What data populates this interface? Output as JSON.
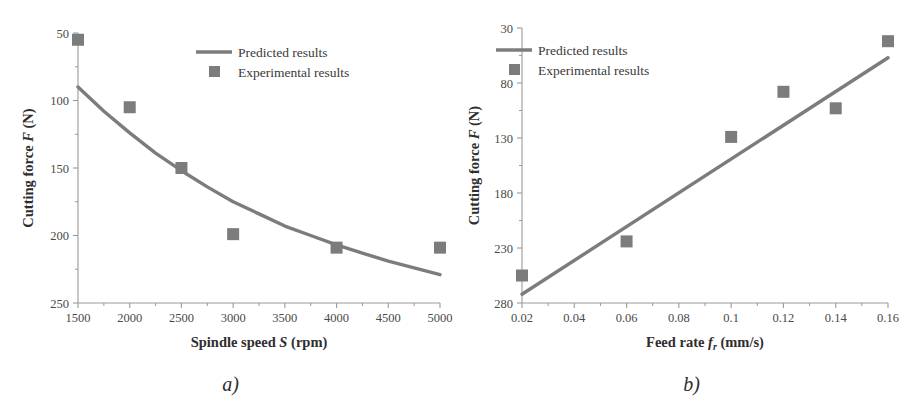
{
  "figure": {
    "background": "#ffffff",
    "series_color": "#7c7c7c",
    "axis_color": "#9a9a9a",
    "text_color": "#3a3a3a"
  },
  "panels": [
    {
      "id": "a",
      "caption": "a)",
      "legend": {
        "line_label": "Predicted results",
        "marker_label": "Experimental results"
      },
      "axes": {
        "xlabel_prefix": "Spindle speed ",
        "xlabel_symbol": "S",
        "xlabel_suffix": " (rpm)",
        "ylabel_prefix": "Cutting force ",
        "ylabel_symbol": "F",
        "ylabel_suffix": " (N)",
        "xticks": [
          "1500",
          "2000",
          "2500",
          "3000",
          "3500",
          "4000",
          "4500",
          "5000"
        ],
        "yticks": [
          "250",
          "200",
          "150",
          "100",
          "50"
        ]
      }
    },
    {
      "id": "b",
      "caption": "b)",
      "legend": {
        "line_label": "Predicted results",
        "marker_label": "Experimental results"
      },
      "axes": {
        "xlabel_prefix": "Feed rate ",
        "xlabel_symbol": "f",
        "xlabel_subscript": "r",
        "xlabel_suffix": " (mm/s)",
        "ylabel_prefix": "Cutting force ",
        "ylabel_symbol": "F",
        "ylabel_suffix": " (N)",
        "xticks": [
          "0.02",
          "0.04",
          "0.06",
          "0.08",
          "0.1",
          "0.12",
          "0.14",
          "0.16"
        ],
        "yticks": [
          "280",
          "230",
          "180",
          "130",
          "80",
          "30"
        ]
      }
    }
  ],
  "chart_data": [
    {
      "type": "scatter",
      "panel": "a",
      "title": "",
      "xlabel": "Spindle speed S (rpm)",
      "ylabel": "Cutting force F (N)",
      "xlim": [
        1500,
        5000
      ],
      "ylim": [
        50,
        250
      ],
      "xticks": [
        1500,
        2000,
        2500,
        3000,
        3500,
        4000,
        4500,
        5000
      ],
      "yticks": [
        50,
        100,
        150,
        200,
        250
      ],
      "minor_ytick_step": 25,
      "minor_xtick_step": 250,
      "grid": false,
      "legend_position": "top-right",
      "series": [
        {
          "name": "Experimental results",
          "marker": "square",
          "color": "#7c7c7c",
          "x": [
            1500,
            2000,
            2500,
            3000,
            4000,
            5000
          ],
          "values": [
            245,
            195,
            150,
            101,
            91,
            91
          ]
        },
        {
          "name": "Predicted results",
          "marker": "line",
          "color": "#7c7c7c",
          "x": [
            1500,
            1750,
            2000,
            2250,
            2500,
            2750,
            3000,
            3250,
            3500,
            3750,
            4000,
            4250,
            4500,
            4750,
            5000
          ],
          "values": [
            210,
            192,
            176,
            161,
            148,
            136,
            125,
            116,
            107,
            100,
            93,
            87,
            81,
            76,
            71
          ]
        }
      ]
    },
    {
      "type": "scatter",
      "panel": "b",
      "title": "",
      "xlabel": "Feed rate f_r (mm/s)",
      "ylabel": "Cutting force F (N)",
      "xlim": [
        0.02,
        0.16
      ],
      "ylim": [
        30,
        280
      ],
      "xticks": [
        0.02,
        0.04,
        0.06,
        0.08,
        0.1,
        0.12,
        0.14,
        0.16
      ],
      "yticks": [
        30,
        80,
        130,
        180,
        230,
        280
      ],
      "minor_ytick_step": 25,
      "minor_xtick_step": 0.01,
      "grid": false,
      "legend_position": "top-left",
      "series": [
        {
          "name": "Experimental results",
          "marker": "square",
          "color": "#7c7c7c",
          "x": [
            0.02,
            0.06,
            0.1,
            0.12,
            0.14,
            0.16
          ],
          "values": [
            55,
            86,
            181,
            222,
            207,
            268
          ]
        },
        {
          "name": "Predicted results",
          "marker": "line",
          "color": "#7c7c7c",
          "x": [
            0.02,
            0.16
          ],
          "values": [
            38,
            253
          ]
        }
      ]
    }
  ]
}
